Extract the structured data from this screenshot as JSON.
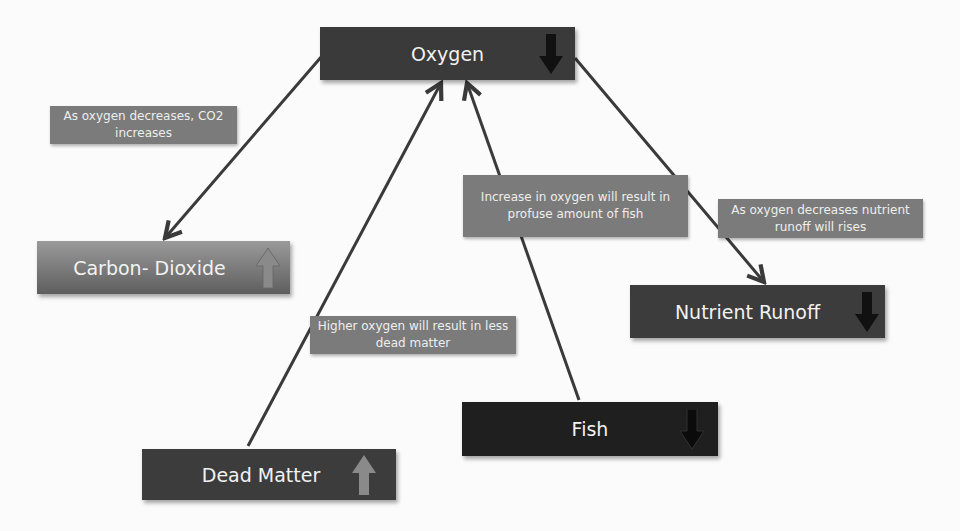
{
  "diagram": {
    "nodes": [
      {
        "id": "oxygen",
        "label": "Oxygen",
        "trend": "down",
        "trend_icon": "arrow-down-icon",
        "color": "#3a3a3a"
      },
      {
        "id": "carbon-dioxide",
        "label": "Carbon- Dioxide",
        "trend": "up",
        "trend_icon": "arrow-up-icon",
        "color": "#7a7a7a"
      },
      {
        "id": "nutrient-runoff",
        "label": "Nutrient Runoff",
        "trend": "down",
        "trend_icon": "arrow-down-icon",
        "color": "#3c3c3c"
      },
      {
        "id": "fish",
        "label": "Fish",
        "trend": "down",
        "trend_icon": "arrow-down-icon",
        "color": "#1f1f1f"
      },
      {
        "id": "dead-matter",
        "label": "Dead Matter",
        "trend": "up",
        "trend_icon": "arrow-up-icon",
        "color": "#3c3c3c"
      }
    ],
    "edges": [
      {
        "from": "oxygen",
        "to": "carbon-dioxide",
        "note": "As oxygen decreases, CO2 increases"
      },
      {
        "from": "dead-matter",
        "to": "oxygen",
        "note": "Higher oxygen will result in less dead matter"
      },
      {
        "from": "fish",
        "to": "oxygen",
        "note": "Increase in oxygen will result in profuse amount of fish"
      },
      {
        "from": "oxygen",
        "to": "nutrient-runoff",
        "note": "As oxygen decreases nutrient runoff will rises"
      }
    ],
    "colors": {
      "note_bg": "#7b7b7b",
      "connector": "#3a3a3a",
      "arrow_down": "#111111",
      "arrow_up": "#8a8a8a"
    }
  }
}
